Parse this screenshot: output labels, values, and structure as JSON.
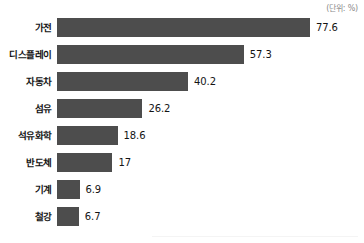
{
  "chart_data": {
    "type": "bar",
    "orientation": "horizontal",
    "title": "",
    "subtitle": "",
    "unit_note": "(단위: %)",
    "xlabel": "",
    "ylabel": "",
    "categories": [
      "가전",
      "디스플레이",
      "자동차",
      "섬유",
      "석유화학",
      "반도체",
      "기계",
      "철강"
    ],
    "values": [
      77.6,
      57.3,
      40.2,
      26.2,
      18.6,
      17,
      6.9,
      6.7
    ],
    "value_labels": [
      "77.6",
      "57.3",
      "40.2",
      "26.2",
      "18.6",
      "17",
      "6.9",
      "6.7"
    ],
    "series": [
      {
        "name": "",
        "values": [
          77.6,
          57.3,
          40.2,
          26.2,
          18.6,
          17,
          6.9,
          6.7
        ]
      }
    ],
    "xlim": [
      0,
      77.6
    ],
    "grid": false,
    "legend": false,
    "bar_color": "#4d4d4d",
    "background_color": "#ffffff"
  }
}
